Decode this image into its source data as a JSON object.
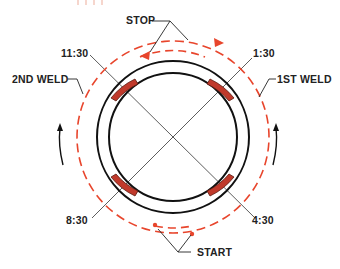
{
  "diagram": {
    "type": "pipe-weld-sequence",
    "colors": {
      "pipe": "#111111",
      "weld_path": "#e8452c",
      "bead_fill": "#c0392b",
      "bead_stroke": "#5a1a10",
      "leader": "#222222"
    },
    "labels": {
      "stop": "STOP",
      "start": "START",
      "first_weld": "1ST WELD",
      "second_weld": "2ND WELD",
      "pos_1130": "11:30",
      "pos_130": "1:30",
      "pos_430": "4:30",
      "pos_830": "8:30"
    },
    "tack_welds": [
      {
        "position": "11:30"
      },
      {
        "position": "1:30"
      },
      {
        "position": "4:30"
      },
      {
        "position": "8:30"
      }
    ],
    "center_mark": "×"
  }
}
